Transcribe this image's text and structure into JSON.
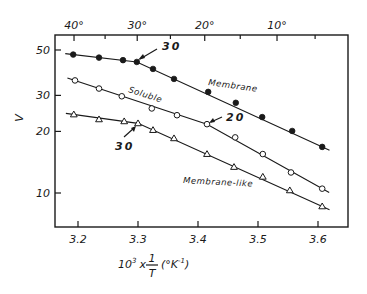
{
  "chart_data": {
    "type": "line",
    "title": "",
    "xlabel": "10³ x 1/T (°K⁻¹)",
    "xlabel_parts": {
      "prefix": "10",
      "sup": "3",
      "times": "x",
      "num": "1",
      "den": "T",
      "unit_open": "(°K",
      "unit_sup": "-1",
      "unit_close": ")"
    },
    "ylabel": "V",
    "x_scale": "linear",
    "y_scale": "log",
    "xlim": [
      3.16,
      3.65
    ],
    "ylim": [
      7.8,
      58
    ],
    "grid": false,
    "x_ticks": [
      3.2,
      3.3,
      3.4,
      3.5,
      3.6
    ],
    "x_tick_labels": [
      "3.2",
      "3.3",
      "3.4",
      "3.5",
      "3.6"
    ],
    "y_ticks": [
      10,
      20,
      30,
      50
    ],
    "y_tick_labels": [
      "10",
      "20",
      "30",
      "50"
    ],
    "top_axis": {
      "label": "Temperature (°C)",
      "major_ticks_celsius": [
        40,
        30,
        20,
        10
      ],
      "major_tick_labels": [
        "40°",
        "30°",
        "20°",
        "10°"
      ],
      "minor_ticks_celsius": [
        35,
        25,
        15,
        5
      ]
    },
    "series": [
      {
        "name": "Membrane",
        "marker": "filled-circle",
        "x": [
          3.192,
          3.235,
          3.275,
          3.298,
          3.325,
          3.36,
          3.417,
          3.463,
          3.507,
          3.557,
          3.607
        ],
        "y": [
          47.5,
          45.9,
          44.6,
          43.7,
          40.4,
          36.1,
          31.2,
          27.6,
          23.5,
          20.1,
          16.8
        ],
        "break_label": "30",
        "break_x": 3.298
      },
      {
        "name": "Soluble",
        "marker": "open-circle",
        "x": [
          3.195,
          3.235,
          3.273,
          3.323,
          3.365,
          3.415,
          3.462,
          3.508,
          3.555,
          3.607
        ],
        "y": [
          35.5,
          32.4,
          29.7,
          25.9,
          24.0,
          21.7,
          18.7,
          15.5,
          12.6,
          10.5
        ],
        "break_label": "20",
        "break_x": 3.415
      },
      {
        "name": "Membrane-like",
        "marker": "open-triangle",
        "x": [
          3.193,
          3.235,
          3.277,
          3.3,
          3.325,
          3.36,
          3.415,
          3.46,
          3.508,
          3.553,
          3.607
        ],
        "y": [
          24.2,
          22.9,
          22.4,
          21.9,
          20.3,
          18.5,
          15.5,
          13.4,
          12.0,
          10.3,
          8.6
        ],
        "break_label": "30",
        "break_x": 3.3
      }
    ],
    "annotations": [
      {
        "text": "Membrane",
        "series": "Membrane"
      },
      {
        "text": "Soluble",
        "series": "Soluble"
      },
      {
        "text": "Membrane-like",
        "series": "Membrane-like"
      },
      {
        "text": "30",
        "type": "arrow",
        "series": "Membrane"
      },
      {
        "text": "20",
        "type": "arrow",
        "series": "Soluble"
      },
      {
        "text": "30",
        "type": "arrow",
        "series": "Membrane-like"
      }
    ]
  }
}
